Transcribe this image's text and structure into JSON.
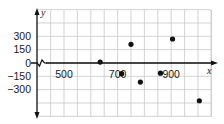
{
  "chart_data": {
    "type": "scatter",
    "title": "",
    "xlabel": "x",
    "ylabel": "y",
    "x_ticks": [
      500,
      700,
      900
    ],
    "y_ticks": [
      300,
      150,
      0,
      -150,
      -300
    ],
    "y_tick_labels": [
      "300",
      "150",
      "0",
      "−150",
      "−300"
    ],
    "x_tick_labels": [
      "500",
      "700",
      "900"
    ],
    "xlim": [
      400,
      1050
    ],
    "ylim": [
      -600,
      600
    ],
    "x_axis_break": true,
    "grid": true,
    "grid_x_step": 50,
    "grid_y_step": 150,
    "points": [
      {
        "x": 635,
        "y": 10
      },
      {
        "x": 715,
        "y": -120
      },
      {
        "x": 750,
        "y": 210
      },
      {
        "x": 785,
        "y": -215
      },
      {
        "x": 860,
        "y": -115
      },
      {
        "x": 905,
        "y": 270
      },
      {
        "x": 1005,
        "y": -425
      }
    ]
  },
  "colors": {
    "grid": "#c8c8c8",
    "axis": "#111111",
    "point": "#111111"
  }
}
